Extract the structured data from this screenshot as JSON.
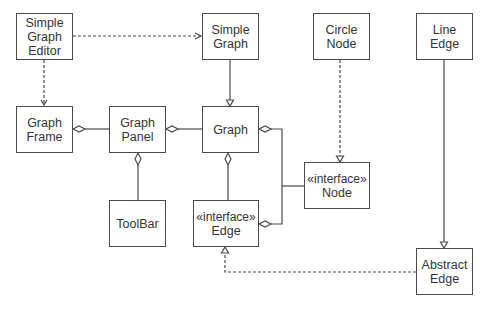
{
  "diagram": {
    "type": "uml-class-diagram",
    "colors": {
      "line": "#4a4a4a",
      "text": "#333333",
      "background": "#ffffff"
    },
    "classes": [
      {
        "id": "simple_graph_editor",
        "lines": [
          "Simple",
          "Graph",
          "Editor"
        ],
        "x": 16,
        "y": 13,
        "w": 57,
        "h": 47
      },
      {
        "id": "simple_graph",
        "lines": [
          "Simple",
          "Graph"
        ],
        "x": 202,
        "y": 13,
        "w": 57,
        "h": 47
      },
      {
        "id": "circle_node",
        "lines": [
          "Circle",
          "Node"
        ],
        "x": 313,
        "y": 13,
        "w": 57,
        "h": 47
      },
      {
        "id": "line_edge",
        "lines": [
          "Line",
          "Edge"
        ],
        "x": 416,
        "y": 13,
        "w": 57,
        "h": 47
      },
      {
        "id": "graph_frame",
        "lines": [
          "Graph",
          "Frame"
        ],
        "x": 16,
        "y": 106,
        "w": 57,
        "h": 47
      },
      {
        "id": "graph_panel",
        "lines": [
          "Graph",
          "Panel"
        ],
        "x": 109,
        "y": 106,
        "w": 57,
        "h": 47
      },
      {
        "id": "graph",
        "lines": [
          "Graph"
        ],
        "x": 202,
        "y": 106,
        "w": 57,
        "h": 47
      },
      {
        "id": "node",
        "lines": [
          "«interface»",
          "Node"
        ],
        "x": 304,
        "y": 162,
        "w": 66,
        "h": 47
      },
      {
        "id": "toolbar",
        "lines": [
          "ToolBar"
        ],
        "x": 109,
        "y": 200,
        "w": 57,
        "h": 47
      },
      {
        "id": "edge",
        "lines": [
          "«interface»",
          "Edge"
        ],
        "x": 193,
        "y": 200,
        "w": 66,
        "h": 47
      },
      {
        "id": "abstract_edge",
        "lines": [
          "Abstract",
          "Edge"
        ],
        "x": 416,
        "y": 248,
        "w": 57,
        "h": 47
      }
    ],
    "relations": [
      {
        "from": "simple_graph_editor",
        "to": "simple_graph",
        "kind": "dependency"
      },
      {
        "from": "simple_graph_editor",
        "to": "graph_frame",
        "kind": "dependency"
      },
      {
        "from": "simple_graph",
        "to": "graph",
        "kind": "generalization"
      },
      {
        "from": "graph_frame",
        "to": "graph_panel",
        "kind": "aggregation",
        "whole": "graph_frame"
      },
      {
        "from": "graph_panel",
        "to": "graph",
        "kind": "aggregation",
        "whole": "graph_panel"
      },
      {
        "from": "graph_panel",
        "to": "toolbar",
        "kind": "aggregation",
        "whole": "graph_panel"
      },
      {
        "from": "graph",
        "to": "edge",
        "kind": "aggregation",
        "whole": "graph"
      },
      {
        "from": "graph",
        "to": "node",
        "kind": "aggregation",
        "whole": "graph"
      },
      {
        "from": "edge",
        "to": "node",
        "kind": "aggregation",
        "whole": "edge"
      },
      {
        "from": "circle_node",
        "to": "node",
        "kind": "realization"
      },
      {
        "from": "line_edge",
        "to": "abstract_edge",
        "kind": "generalization"
      },
      {
        "from": "abstract_edge",
        "to": "edge",
        "kind": "realization"
      }
    ]
  }
}
